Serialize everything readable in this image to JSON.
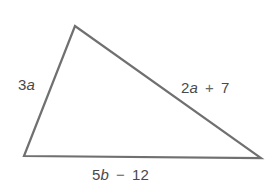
{
  "figure": {
    "type": "triangle",
    "stroke_color": "#707070",
    "background": "#ffffff",
    "vertices": {
      "top": [
        75,
        26
      ],
      "bottom_left": [
        24,
        156
      ],
      "bottom_right": [
        261,
        158
      ]
    }
  },
  "sides": {
    "left": {
      "coef": "3",
      "var": "a",
      "op": "",
      "const": ""
    },
    "right": {
      "coef": "2",
      "var": "a",
      "op": "+",
      "const": "7"
    },
    "bottom": {
      "coef": "5",
      "var": "b",
      "op": "−",
      "const": "12"
    }
  }
}
